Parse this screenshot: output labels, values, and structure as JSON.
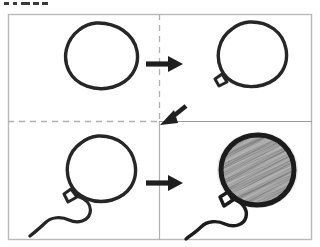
{
  "figure": {
    "title": "Balloon drawing step sequence",
    "canvas": {
      "width": 320,
      "height": 247
    },
    "background_color": "#ffffff",
    "ink_color": "#262626",
    "border_color": "#b9b9b9"
  },
  "frame": {
    "name": "outer-frame",
    "x": 8,
    "y": 14,
    "width": 304,
    "height": 226,
    "stroke_color": "#b9b9b9",
    "stroke_width": 1.4
  },
  "dividers": [
    {
      "name": "divider-vertical-top",
      "orientation": "vertical",
      "style": "dashed",
      "x": 159,
      "y1": 14,
      "y2": 121,
      "color": "#b0b0b0"
    },
    {
      "name": "divider-vertical-bottom",
      "orientation": "vertical",
      "style": "solid",
      "x": 159,
      "y1": 121,
      "y2": 240,
      "color": "#b0b0b0"
    },
    {
      "name": "divider-horizontal-left",
      "orientation": "horizontal",
      "style": "dashed",
      "y": 121,
      "x1": 8,
      "x2": 159,
      "color": "#b0b0b0"
    },
    {
      "name": "divider-horizontal-right",
      "orientation": "horizontal",
      "style": "solid",
      "y": 121,
      "x1": 159,
      "x2": 312,
      "color": "#9a9a9a"
    }
  ],
  "panels": [
    {
      "index": 1,
      "name": "panel-step-1",
      "position": "top-left",
      "step_label": "Step 1",
      "caption": "Draw a circle",
      "balloon": {
        "has_outline": true,
        "has_knot": false,
        "has_string": false,
        "is_shaded": false,
        "fill": "none"
      }
    },
    {
      "index": 2,
      "name": "panel-step-2",
      "position": "top-right",
      "step_label": "Step 2",
      "caption": "Add the knot",
      "balloon": {
        "has_outline": true,
        "has_knot": true,
        "has_string": false,
        "is_shaded": false,
        "fill": "none"
      }
    },
    {
      "index": 3,
      "name": "panel-step-3",
      "position": "bottom-left",
      "step_label": "Step 3",
      "caption": "Add the string",
      "balloon": {
        "has_outline": true,
        "has_knot": true,
        "has_string": true,
        "is_shaded": false,
        "fill": "none"
      }
    },
    {
      "index": 4,
      "name": "panel-step-4",
      "position": "bottom-right",
      "step_label": "Step 4",
      "caption": "Shade the balloon",
      "balloon": {
        "has_outline": true,
        "has_knot": true,
        "has_string": true,
        "is_shaded": true,
        "fill": "#9b9b9b"
      }
    }
  ],
  "arrows": [
    {
      "name": "arrow-step-1-to-2",
      "direction": "right",
      "from_panel": 1,
      "to_panel": 2,
      "x": 148,
      "y": 64,
      "length": 34,
      "color": "#1f1f1f"
    },
    {
      "name": "arrow-step-2-to-3",
      "direction": "down-left",
      "from_panel": 2,
      "to_panel": 3,
      "x": 168,
      "y": 113,
      "length": 30,
      "color": "#1f1f1f"
    },
    {
      "name": "arrow-step-3-to-4",
      "direction": "right",
      "from_panel": 3,
      "to_panel": 4,
      "x": 148,
      "y": 183,
      "length": 34,
      "color": "#1f1f1f"
    }
  ],
  "top_clipped_mark": {
    "name": "top-clipped-text-sliver",
    "visible_description": "bottom sliver of cropped dark characters along the upper-left edge",
    "color": "#3a3a3a"
  }
}
